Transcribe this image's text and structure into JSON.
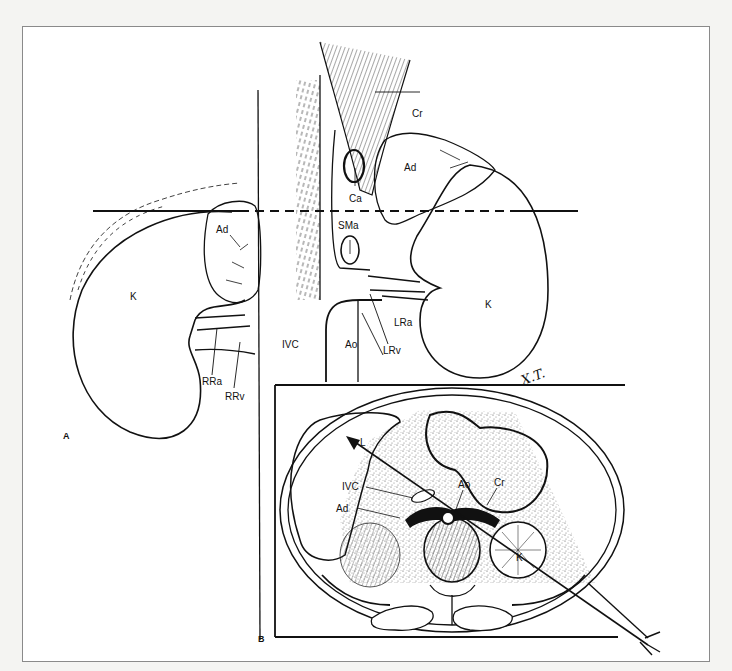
{
  "figure": {
    "panels": [
      {
        "id": "A",
        "label": "A"
      },
      {
        "id": "B",
        "label": "B"
      }
    ],
    "panel_a": {
      "labels": {
        "right_kidney": "K",
        "right_adrenal": "Ad",
        "right_renal_artery": "RRa",
        "right_renal_vein": "RRv",
        "ivc": "IVC",
        "aorta": "Ao",
        "celiac_artery": "Ca",
        "superior_mesenteric_artery": "SMa",
        "crus": "Cr",
        "left_adrenal": "Ad",
        "left_kidney": "K",
        "left_renal_artery": "LRa",
        "left_renal_vein": "LRv"
      },
      "signature": "X.T."
    },
    "panel_b": {
      "labels": {
        "liver": "L",
        "ivc": "IVC",
        "adrenal": "Ad",
        "aorta": "Ao",
        "crus": "Cr",
        "kidney": "K"
      }
    },
    "colors": {
      "ink": "#111111",
      "paper": "#ffffff",
      "background": "#f4f4f2",
      "stipple": "#c9c9c9",
      "frame_border": "#8a8a8a"
    }
  }
}
